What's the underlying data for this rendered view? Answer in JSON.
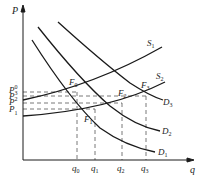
{
  "diagram": {
    "type": "supply-demand",
    "axes": {
      "y_label": "P",
      "x_label": "q"
    },
    "price_levels": [
      {
        "label": "P",
        "sub": "0",
        "y": 92
      },
      {
        "label": "P",
        "sub": "3",
        "y": 96
      },
      {
        "label": "P",
        "sub": "2",
        "y": 103
      },
      {
        "label": "P",
        "sub": "1",
        "y": 109
      }
    ],
    "quantity_levels": [
      {
        "label": "q",
        "sub": "0",
        "x": 77
      },
      {
        "label": "q",
        "sub": "1",
        "x": 95
      },
      {
        "label": "q",
        "sub": "2",
        "x": 122
      },
      {
        "label": "q",
        "sub": "3",
        "x": 146
      }
    ],
    "curves": [
      {
        "name": "S",
        "sub": "1",
        "kind": "supply"
      },
      {
        "name": "S",
        "sub": "2",
        "kind": "supply"
      },
      {
        "name": "D",
        "sub": "1",
        "kind": "demand"
      },
      {
        "name": "D",
        "sub": "2",
        "kind": "demand"
      },
      {
        "name": "D",
        "sub": "3",
        "kind": "demand"
      }
    ],
    "equilibria": [
      {
        "label": "F",
        "sub": "0"
      },
      {
        "label": "F",
        "sub": "1"
      },
      {
        "label": "F",
        "sub": "2"
      },
      {
        "label": "F",
        "sub": "3"
      }
    ],
    "colors": {
      "line": "#1a1a1a",
      "dash": "#555555"
    }
  }
}
